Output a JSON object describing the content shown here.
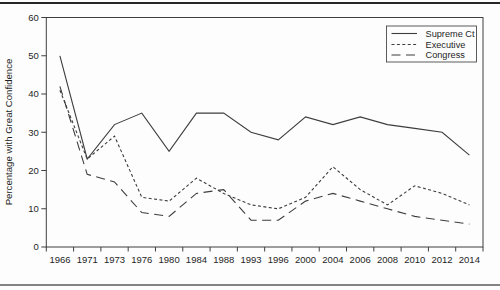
{
  "chart_data": {
    "type": "line",
    "title": "",
    "ylabel": "Percentage with Great Confidence",
    "xlabel": "",
    "ylim": [
      0,
      60
    ],
    "ytick_interval": 10,
    "grid": false,
    "legend_position": "top-right",
    "line_color": "#3d3d3d",
    "categories": [
      "1966",
      "1971",
      "1973",
      "1976",
      "1980",
      "1984",
      "1988",
      "1993",
      "1996",
      "2000",
      "2004",
      "2006",
      "2008",
      "2010",
      "2012",
      "2014"
    ],
    "series": [
      {
        "name": "Supreme Ct",
        "line_style": "solid",
        "values": [
          50,
          23,
          32,
          35,
          25,
          35,
          35,
          30,
          28,
          34,
          32,
          34,
          32,
          31,
          30,
          24
        ]
      },
      {
        "name": "Executive",
        "line_style": "short-dash",
        "values": [
          41,
          23,
          29,
          13,
          12,
          18,
          14,
          11,
          10,
          13,
          21,
          15,
          11,
          16,
          14,
          11
        ]
      },
      {
        "name": "Congress",
        "line_style": "long-dash",
        "values": [
          42,
          19,
          17,
          9,
          8,
          14,
          15,
          7,
          7,
          12,
          14,
          12,
          10,
          8,
          7,
          6
        ]
      }
    ]
  }
}
